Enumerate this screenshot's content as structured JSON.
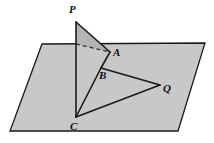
{
  "figure": {
    "background_color": "#ffffff",
    "stroke_color": "#1a1a1a",
    "plane_fill": "#c8c8c8",
    "triangle_fill": "#b4b4b4",
    "plane": {
      "name": "plane",
      "points": "42,44 205,43 178,131 10,131"
    },
    "shaded_triangle_upper": {
      "name": "triangle-PA-above-plane",
      "points": "76,22 110,52 76,44"
    },
    "segments": [
      {
        "name": "segment-P-C",
        "from": "76,22",
        "to": "76,117"
      },
      {
        "name": "segment-P-A",
        "from": "76,22",
        "to": "110,52"
      },
      {
        "name": "segment-A-B",
        "from": "110,52",
        "to": "101,68"
      },
      {
        "name": "segment-B-C",
        "from": "101,68",
        "to": "76,117"
      },
      {
        "name": "segment-B-Q",
        "from": "101,68",
        "to": "160,85"
      },
      {
        "name": "segment-C-Q",
        "from": "76,117",
        "to": "160,85"
      }
    ],
    "dashed_segment": {
      "name": "segment-dashed-P-foot-to-A",
      "from": "76,44",
      "to": "110,52"
    },
    "labels": [
      {
        "name": "label-P",
        "text": "P",
        "x": 69,
        "y": 4
      },
      {
        "name": "label-A",
        "text": "A",
        "x": 113,
        "y": 47
      },
      {
        "name": "label-B",
        "text": "B",
        "x": 99,
        "y": 70
      },
      {
        "name": "label-Q",
        "text": "Q",
        "x": 163,
        "y": 83
      },
      {
        "name": "label-C",
        "text": "C",
        "x": 70,
        "y": 121
      }
    ]
  }
}
